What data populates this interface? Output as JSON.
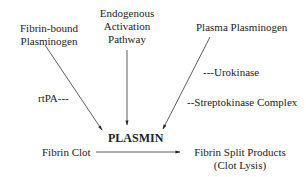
{
  "diagram": {
    "sources": {
      "fibrin_bound": [
        "Fibrin-bound",
        "Plasminogen"
      ],
      "endogenous": [
        "Endogenous",
        "Activation",
        "Pathway"
      ],
      "plasma": "Plasma Plasminogen"
    },
    "activators": {
      "rtpa": "rtPA---",
      "urokinase": "---Urokinase",
      "streptokinase": "--Streptokinase Complex"
    },
    "center": "PLASMIN",
    "substrate": "Fibrin Clot",
    "products": [
      "Fibrin Split Products",
      "(Clot Lysis)"
    ]
  }
}
